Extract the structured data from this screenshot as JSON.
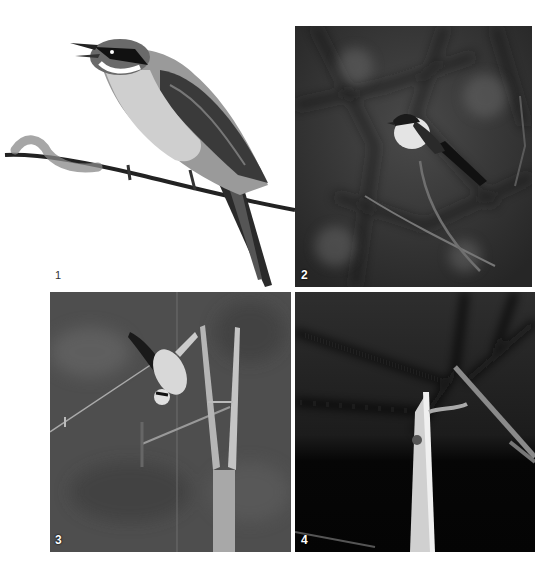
{
  "figure": {
    "panels": [
      {
        "label": "1",
        "subject": "shrike perched on twig, white background (cutout)"
      },
      {
        "label": "2",
        "subject": "shrike perched on branch, dark blurred background"
      },
      {
        "label": "3",
        "subject": "shrike hanging upside down on bamboo stake with wire"
      },
      {
        "label": "4",
        "subject": "broken bamboo stake with impaled prey, dark background"
      }
    ]
  },
  "colors": {
    "page_background": "#ffffff",
    "photo_mid_gray": "#5a5a5a",
    "photo_dark": "#1a1a1a"
  }
}
